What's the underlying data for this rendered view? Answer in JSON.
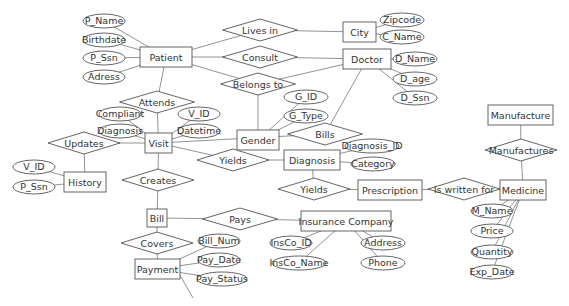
{
  "diagram": {
    "entities": [
      {
        "id": "patient",
        "label": "Patient",
        "x": 140,
        "y": 47,
        "w": 52,
        "h": 20
      },
      {
        "id": "city",
        "label": "City",
        "x": 343,
        "y": 22,
        "w": 33,
        "h": 20
      },
      {
        "id": "doctor",
        "label": "Doctor",
        "x": 343,
        "y": 49,
        "w": 48,
        "h": 20
      },
      {
        "id": "gender",
        "label": "Gender",
        "x": 237,
        "y": 130,
        "w": 42,
        "h": 20
      },
      {
        "id": "visit",
        "label": "Visit",
        "x": 145,
        "y": 133,
        "w": 27,
        "h": 20
      },
      {
        "id": "history",
        "label": "History",
        "x": 64,
        "y": 172,
        "w": 42,
        "h": 20
      },
      {
        "id": "diagnosis",
        "label": "Diagnosis",
        "x": 284,
        "y": 150,
        "w": 56,
        "h": 20
      },
      {
        "id": "prescription",
        "label": "Prescription",
        "x": 358,
        "y": 180,
        "w": 64,
        "h": 20
      },
      {
        "id": "manufacture",
        "label": "Manufacture",
        "x": 488,
        "y": 105,
        "w": 65,
        "h": 20
      },
      {
        "id": "medicine",
        "label": "Medicine",
        "x": 500,
        "y": 180,
        "w": 46,
        "h": 20
      },
      {
        "id": "bill",
        "label": "Bill",
        "x": 147,
        "y": 209,
        "w": 20,
        "h": 18
      },
      {
        "id": "payment",
        "label": "Payment",
        "x": 135,
        "y": 259,
        "w": 45,
        "h": 20
      },
      {
        "id": "insurance",
        "label": "Insurance Company",
        "x": 301,
        "y": 211,
        "w": 90,
        "h": 20
      }
    ],
    "relationships": [
      {
        "id": "lives_in",
        "label": "Lives in",
        "cx": 260,
        "cy": 30,
        "w": 75,
        "h": 22
      },
      {
        "id": "consult",
        "label": "Consult",
        "cx": 260,
        "cy": 57,
        "w": 75,
        "h": 22
      },
      {
        "id": "belongs_to",
        "label": "Belongs to",
        "cx": 258,
        "cy": 84,
        "w": 75,
        "h": 22
      },
      {
        "id": "attends",
        "label": "Attends",
        "cx": 157,
        "cy": 102,
        "w": 75,
        "h": 22
      },
      {
        "id": "updates",
        "label": "Updates",
        "cx": 84,
        "cy": 143,
        "w": 72,
        "h": 22
      },
      {
        "id": "bills",
        "label": "Bills",
        "cx": 325,
        "cy": 134,
        "w": 75,
        "h": 22
      },
      {
        "id": "yields1",
        "label": "Yields",
        "cx": 233,
        "cy": 160,
        "w": 72,
        "h": 22
      },
      {
        "id": "yields2",
        "label": "Yields",
        "cx": 314,
        "cy": 189,
        "w": 72,
        "h": 22
      },
      {
        "id": "is_written_for",
        "label": "Is written for",
        "cx": 464,
        "cy": 189,
        "w": 72,
        "h": 22
      },
      {
        "id": "manufactures",
        "label": "Manufactures",
        "cx": 521,
        "cy": 150,
        "w": 72,
        "h": 22
      },
      {
        "id": "creates",
        "label": "Creates",
        "cx": 158,
        "cy": 180,
        "w": 72,
        "h": 22
      },
      {
        "id": "pays",
        "label": "Pays",
        "cx": 240,
        "cy": 219,
        "w": 75,
        "h": 22
      },
      {
        "id": "covers",
        "label": "Covers",
        "cx": 157,
        "cy": 243,
        "w": 72,
        "h": 22
      }
    ],
    "attributes": [
      {
        "id": "p_name",
        "label": "P_Name",
        "cx": 104,
        "cy": 21,
        "rx": 21,
        "ry": 7,
        "of": "patient"
      },
      {
        "id": "birthdate",
        "label": "Birthdate",
        "cx": 104,
        "cy": 40,
        "rx": 21,
        "ry": 7,
        "of": "patient"
      },
      {
        "id": "p_ssn",
        "label": "P_Ssn",
        "cx": 104,
        "cy": 58,
        "rx": 21,
        "ry": 7,
        "of": "patient"
      },
      {
        "id": "adress",
        "label": "Adress",
        "cx": 104,
        "cy": 77,
        "rx": 21,
        "ry": 7,
        "of": "patient"
      },
      {
        "id": "zipcode",
        "label": "Zipcode",
        "cx": 402,
        "cy": 20,
        "rx": 22,
        "ry": 7,
        "of": "city"
      },
      {
        "id": "c_name",
        "label": "C_Name",
        "cx": 402,
        "cy": 37,
        "rx": 22,
        "ry": 7,
        "of": "city"
      },
      {
        "id": "d_name",
        "label": "D_Name",
        "cx": 415,
        "cy": 59,
        "rx": 22,
        "ry": 7,
        "of": "doctor"
      },
      {
        "id": "d_age",
        "label": "D_age",
        "cx": 415,
        "cy": 79,
        "rx": 22,
        "ry": 7,
        "of": "doctor"
      },
      {
        "id": "d_ssn",
        "label": "D_Ssn",
        "cx": 415,
        "cy": 98,
        "rx": 22,
        "ry": 7,
        "of": "doctor"
      },
      {
        "id": "g_id",
        "label": "G_ID",
        "cx": 306,
        "cy": 97,
        "rx": 22,
        "ry": 7,
        "of": "gender"
      },
      {
        "id": "g_type",
        "label": "G_Type",
        "cx": 306,
        "cy": 116,
        "rx": 22,
        "ry": 7,
        "of": "gender"
      },
      {
        "id": "compliant",
        "label": "Compliant",
        "cx": 120,
        "cy": 114,
        "rx": 21,
        "ry": 7,
        "of": "visit"
      },
      {
        "id": "diagnosis_attr",
        "label": "Diagnosis",
        "cx": 120,
        "cy": 131,
        "rx": 21,
        "ry": 7,
        "of": "visit"
      },
      {
        "id": "v_id_visit",
        "label": "V_ID",
        "cx": 199,
        "cy": 114,
        "rx": 21,
        "ry": 7,
        "of": "visit"
      },
      {
        "id": "datetime",
        "label": "Datetime",
        "cx": 199,
        "cy": 131,
        "rx": 21,
        "ry": 7,
        "of": "visit"
      },
      {
        "id": "v_id_history",
        "label": "V_ID",
        "cx": 34,
        "cy": 167,
        "rx": 21,
        "ry": 7,
        "of": "history"
      },
      {
        "id": "p_ssn_history",
        "label": "P_Ssn",
        "cx": 34,
        "cy": 187,
        "rx": 21,
        "ry": 7,
        "of": "history"
      },
      {
        "id": "diagnosis_id",
        "label": "Diagnosis_ID",
        "cx": 372,
        "cy": 146,
        "rx": 27,
        "ry": 7,
        "of": "diagnosis"
      },
      {
        "id": "category",
        "label": "Category",
        "cx": 373,
        "cy": 164,
        "rx": 22,
        "ry": 7,
        "of": "diagnosis"
      },
      {
        "id": "m_name",
        "label": "M_Name",
        "cx": 492,
        "cy": 211,
        "rx": 21,
        "ry": 7,
        "of": "medicine"
      },
      {
        "id": "price",
        "label": "Price",
        "cx": 492,
        "cy": 231,
        "rx": 21,
        "ry": 7,
        "of": "medicine"
      },
      {
        "id": "quantity",
        "label": "Quantity",
        "cx": 492,
        "cy": 252,
        "rx": 21,
        "ry": 7,
        "of": "medicine"
      },
      {
        "id": "exp_date",
        "label": "Exp_Date",
        "cx": 492,
        "cy": 272,
        "rx": 21,
        "ry": 7,
        "of": "medicine"
      },
      {
        "id": "bill_num",
        "label": "Bill_Num",
        "cx": 219,
        "cy": 241,
        "rx": 21,
        "ry": 7,
        "of": "payment"
      },
      {
        "id": "pay_date",
        "label": "Pay_Date",
        "cx": 219,
        "cy": 260,
        "rx": 21,
        "ry": 7,
        "of": "payment"
      },
      {
        "id": "pay_status",
        "label": "Pay_Status",
        "cx": 222,
        "cy": 279,
        "rx": 25,
        "ry": 7,
        "of": "payment"
      },
      {
        "id": "insco_id",
        "label": "InsCo_ID",
        "cx": 291,
        "cy": 243,
        "rx": 21,
        "ry": 7,
        "of": "insurance"
      },
      {
        "id": "insco_name",
        "label": "InsCo_Name",
        "cx": 299,
        "cy": 263,
        "rx": 27,
        "ry": 7,
        "of": "insurance"
      },
      {
        "id": "address",
        "label": "Address",
        "cx": 383,
        "cy": 243,
        "rx": 22,
        "ry": 7,
        "of": "insurance"
      },
      {
        "id": "phone",
        "label": "Phone",
        "cx": 383,
        "cy": 263,
        "rx": 22,
        "ry": 7,
        "of": "insurance"
      }
    ],
    "edges": [
      [
        "patient",
        "lives_in"
      ],
      [
        "lives_in",
        "city"
      ],
      [
        "patient",
        "consult"
      ],
      [
        "consult",
        "doctor"
      ],
      [
        "patient",
        "belongs_to"
      ],
      [
        "belongs_to",
        "doctor"
      ],
      [
        "belongs_to",
        "gender"
      ],
      [
        "patient",
        "attends"
      ],
      [
        "attends",
        "visit"
      ],
      [
        "visit",
        "updates"
      ],
      [
        "updates",
        "history"
      ],
      [
        "visit",
        "bills"
      ],
      [
        "bills",
        "doctor"
      ],
      [
        "visit",
        "yields1"
      ],
      [
        "yields1",
        "diagnosis"
      ],
      [
        "diagnosis",
        "yields2"
      ],
      [
        "yields2",
        "prescription"
      ],
      [
        "prescription",
        "is_written_for"
      ],
      [
        "is_written_for",
        "medicine"
      ],
      [
        "manufacture",
        "manufactures"
      ],
      [
        "manufactures",
        "medicine"
      ],
      [
        "visit",
        "creates"
      ],
      [
        "creates",
        "bill"
      ],
      [
        "bill",
        "pays"
      ],
      [
        "pays",
        "insurance"
      ],
      [
        "bill",
        "covers"
      ],
      [
        "covers",
        "payment"
      ]
    ]
  }
}
